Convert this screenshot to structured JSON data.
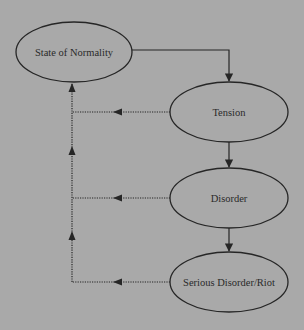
{
  "diagram": {
    "background": "#a9a9a9",
    "stroke_color": "#262626",
    "nodes": [
      {
        "id": "normality",
        "label": "State of Normality",
        "cx": 74,
        "cy": 52,
        "rx": 58,
        "ry": 30
      },
      {
        "id": "tension",
        "label": "Tension",
        "cx": 229,
        "cy": 112,
        "rx": 59,
        "ry": 30
      },
      {
        "id": "disorder",
        "label": "Disorder",
        "cx": 229,
        "cy": 198,
        "rx": 59,
        "ry": 30
      },
      {
        "id": "serious",
        "label": "Serious Disorder/Riot",
        "cx": 229,
        "cy": 282,
        "rx": 59,
        "ry": 30
      }
    ],
    "edges": [
      {
        "from": "normality",
        "to": "tension",
        "style": "solid"
      },
      {
        "from": "tension",
        "to": "disorder",
        "style": "solid"
      },
      {
        "from": "disorder",
        "to": "serious",
        "style": "solid"
      },
      {
        "from": "tension",
        "to": "normality",
        "style": "dotted"
      },
      {
        "from": "disorder",
        "to": "normality",
        "style": "dotted"
      },
      {
        "from": "serious",
        "to": "normality",
        "style": "dotted"
      }
    ]
  }
}
